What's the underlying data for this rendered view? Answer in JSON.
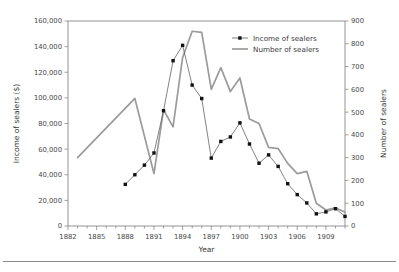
{
  "figure": {
    "name": "income-and-number-of-sealers-chart",
    "background": "#ffffff",
    "has_bottom_rule": true
  },
  "chart_data": {
    "type": "line",
    "title": "",
    "xlabel": "Year",
    "ylabel": "Income of sealers ($)",
    "y2label": "Number of sealers",
    "xlim": [
      1882,
      1911
    ],
    "ylim": [
      0,
      160000
    ],
    "y2lim": [
      0,
      900
    ],
    "grid": false,
    "legend_position": "upper-right-inside",
    "x_tick_labels": [
      "1882",
      "1885",
      "1888",
      "1891",
      "1894",
      "1897",
      "1900",
      "1903",
      "1906",
      "1909"
    ],
    "x_tick_values": [
      1882,
      1885,
      1888,
      1891,
      1894,
      1897,
      1900,
      1903,
      1906,
      1909
    ],
    "x_minor_ticks_every": 1,
    "y_tick_labels": [
      "0",
      "20,000",
      "40,000",
      "60,000",
      "80,000",
      "100,000",
      "120,000",
      "140,000",
      "160,000"
    ],
    "y_tick_values": [
      0,
      20000,
      40000,
      60000,
      80000,
      100000,
      120000,
      140000,
      160000
    ],
    "y2_tick_labels": [
      "0",
      "100",
      "200",
      "300",
      "400",
      "500",
      "600",
      "700",
      "800",
      "900"
    ],
    "y2_tick_values": [
      0,
      100,
      200,
      300,
      400,
      500,
      600,
      700,
      800,
      900
    ],
    "series": [
      {
        "name": "Income of sealers",
        "axis": "left",
        "color": "#5a5a5a",
        "marker": "square",
        "marker_color": "#111111",
        "x": [
          1888,
          1889,
          1890,
          1891,
          1892,
          1893,
          1894,
          1895,
          1896,
          1897,
          1898,
          1899,
          1900,
          1901,
          1902,
          1903,
          1904,
          1905,
          1906,
          1907,
          1908,
          1909,
          1910,
          1911
        ],
        "values": [
          32500,
          40000,
          47500,
          57000,
          90000,
          129000,
          141000,
          110000,
          99500,
          53000,
          66000,
          69500,
          80500,
          64000,
          49000,
          55500,
          46500,
          33000,
          24500,
          18000,
          9500,
          11000,
          13500,
          7500
        ]
      },
      {
        "name": "Number of sealers",
        "axis": "right",
        "color": "#9b9b9b",
        "marker": "none",
        "x": [
          1883,
          1889,
          1891,
          1892,
          1893,
          1894,
          1895,
          1896,
          1897,
          1898,
          1899,
          1900,
          1901,
          1902,
          1903,
          1904,
          1905,
          1906,
          1907,
          1908,
          1909,
          1910,
          1911
        ],
        "values": [
          300,
          560,
          230,
          510,
          435,
          740,
          855,
          850,
          600,
          695,
          590,
          650,
          470,
          450,
          345,
          340,
          275,
          230,
          240,
          100,
          70,
          80,
          60
        ]
      }
    ]
  },
  "legend": {
    "items": [
      {
        "label": "Income of sealers"
      },
      {
        "label": "Number of sealers"
      }
    ]
  }
}
